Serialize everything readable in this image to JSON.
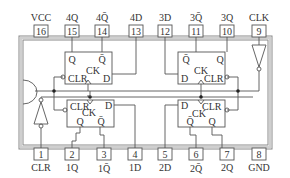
{
  "colors": {
    "line": "#555555",
    "chip_border": "#888888",
    "text": "#333333",
    "background": "#ffffff"
  },
  "top_pins": [
    {
      "num": "16",
      "label": "VCC"
    },
    {
      "num": "15",
      "label": "4Q"
    },
    {
      "num": "14",
      "label": "4Q̄"
    },
    {
      "num": "13",
      "label": "4D"
    },
    {
      "num": "12",
      "label": "3D"
    },
    {
      "num": "11",
      "label": "3Q̄"
    },
    {
      "num": "10",
      "label": "3Q"
    },
    {
      "num": "9",
      "label": "CLK"
    }
  ],
  "bottom_pins": [
    {
      "num": "1",
      "label": "CLR"
    },
    {
      "num": "2",
      "label": "1Q"
    },
    {
      "num": "3",
      "label": "1Q̄"
    },
    {
      "num": "4",
      "label": "1D"
    },
    {
      "num": "5",
      "label": "2D"
    },
    {
      "num": "6",
      "label": "2Q̄"
    },
    {
      "num": "7",
      "label": "2Q"
    },
    {
      "num": "8",
      "label": "GND"
    }
  ],
  "flip_flops": [
    {
      "id": "ff4",
      "q": "Q",
      "qbar": "Q̄",
      "ck": "CK",
      "clr": "CLR",
      "d": "D"
    },
    {
      "id": "ff3",
      "q": "Q",
      "qbar": "Q̄",
      "ck": "CK",
      "clr": "CLR",
      "d": "D"
    },
    {
      "id": "ff1",
      "q": "Q",
      "qbar": "Q̄",
      "ck": "CK",
      "clr": "CLR",
      "d": "D"
    },
    {
      "id": "ff2",
      "q": "Q",
      "qbar": "Q̄",
      "ck": "CK",
      "clr": "CLR",
      "d": "D"
    }
  ]
}
